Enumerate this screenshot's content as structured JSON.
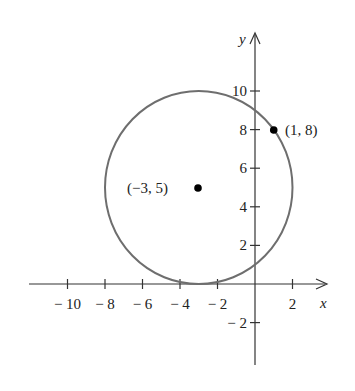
{
  "figure": {
    "colors": {
      "axis": "#333333",
      "circle": "#6e6e6e",
      "point": "#000000",
      "text": "#222222"
    },
    "axes": {
      "x_label": "x",
      "y_label": "y",
      "x_ticks": [
        {
          "value": -10,
          "label": "− 10"
        },
        {
          "value": -8,
          "label": "− 8"
        },
        {
          "value": -6,
          "label": "− 6"
        },
        {
          "value": -4,
          "label": "− 4"
        },
        {
          "value": -2,
          "label": "− 2"
        },
        {
          "value": 2,
          "label": "2"
        }
      ],
      "y_ticks": [
        {
          "value": 10,
          "label": "10"
        },
        {
          "value": 8,
          "label": "8"
        },
        {
          "value": 6,
          "label": "6"
        },
        {
          "value": 4,
          "label": "4"
        },
        {
          "value": 2,
          "label": "2"
        },
        {
          "value": -2,
          "label": "− 2"
        }
      ],
      "x_range": [
        -12,
        3
      ],
      "y_range": [
        -4,
        13
      ]
    },
    "circle": {
      "center": [
        -3,
        5
      ],
      "radius": 5
    },
    "points": [
      {
        "name": "center",
        "x": -3,
        "y": 5,
        "label": "(−3, 5)"
      },
      {
        "name": "point-on-circle",
        "x": 1,
        "y": 8,
        "label": "(1, 8)"
      }
    ]
  }
}
